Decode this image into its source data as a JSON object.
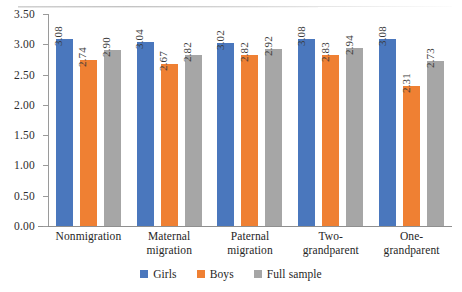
{
  "chart_data": {
    "type": "bar",
    "title": "",
    "subtitle": "",
    "xlabel": "",
    "ylabel": "",
    "ylim": [
      0.0,
      3.5
    ],
    "ytick_labels": [
      "0.00",
      "0.50",
      "1.00",
      "1.50",
      "2.00",
      "2.50",
      "3.00",
      "3.50"
    ],
    "ytick_values": [
      0.0,
      0.5,
      1.0,
      1.5,
      2.0,
      2.5,
      3.0,
      3.5
    ],
    "grid": false,
    "legend_position": "bottom-center",
    "categories": [
      "Nonmigration",
      "Maternal migration",
      "Paternal migration",
      "Two-grandparent",
      "One-grandparent"
    ],
    "category_lines": [
      [
        "Nonmigration"
      ],
      [
        "Maternal",
        "migration"
      ],
      [
        "Paternal",
        "migration"
      ],
      [
        "Two-",
        "grandparent"
      ],
      [
        "One-",
        "grandparent"
      ]
    ],
    "series": [
      {
        "name": "Girls",
        "color": "#4a77bd",
        "values": [
          3.08,
          3.04,
          3.02,
          3.08,
          3.08
        ],
        "labels": [
          "3.08",
          "3.04",
          "3.02",
          "3.08",
          "3.08"
        ]
      },
      {
        "name": "Boys",
        "color": "#ef8033",
        "values": [
          2.74,
          2.67,
          2.82,
          2.83,
          2.31
        ],
        "labels": [
          "2.74",
          "2.67",
          "2.82",
          "2.83",
          "2.31"
        ]
      },
      {
        "name": "Full sample",
        "color": "#a6a6a6",
        "values": [
          2.9,
          2.82,
          2.92,
          2.94,
          2.73
        ],
        "labels": [
          "2.90",
          "2.82",
          "2.92",
          "2.94",
          "2.73"
        ]
      }
    ]
  },
  "legend": {
    "items": [
      {
        "label": "Girls",
        "color": "#4a77bd",
        "key": "girls"
      },
      {
        "label": "Boys",
        "color": "#ef8033",
        "key": "boys"
      },
      {
        "label": "Full sample",
        "color": "#a6a6a6",
        "key": "fullsample"
      }
    ]
  }
}
